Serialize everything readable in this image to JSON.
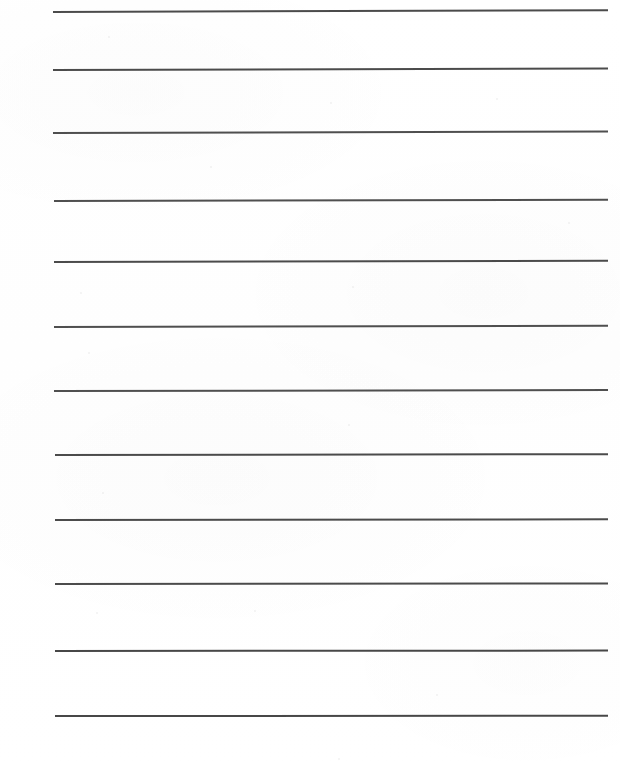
{
  "document": {
    "type": "scanned-blank-lined-paper",
    "title": "Blank lined writing paper",
    "orientation": "portrait",
    "page_width": 620,
    "page_height": 771,
    "background_color": "#ffffff",
    "text_content": "",
    "has_text": false,
    "has_header": false,
    "has_footer": false,
    "page_number": ""
  },
  "ruling": {
    "line_count": 12,
    "line_color": "#3c3c3c",
    "line_thickness_px": 2,
    "left_margin_px": 52,
    "right_margin_px": 12,
    "line_length_px": 556,
    "average_spacing_px": 64,
    "lines": [
      {
        "index": 1,
        "y": 11,
        "x_start": 53,
        "x_end": 608,
        "tilt_deg": -0.18,
        "thickness": 2.0,
        "opacity": 0.92
      },
      {
        "index": 2,
        "y": 69,
        "x_start": 53,
        "x_end": 608,
        "tilt_deg": -0.16,
        "thickness": 2.0,
        "opacity": 0.92
      },
      {
        "index": 3,
        "y": 132,
        "x_start": 53,
        "x_end": 608,
        "tilt_deg": -0.15,
        "thickness": 2.0,
        "opacity": 0.9
      },
      {
        "index": 4,
        "y": 200,
        "x_start": 54,
        "x_end": 608,
        "tilt_deg": -0.14,
        "thickness": 2.0,
        "opacity": 0.9
      },
      {
        "index": 5,
        "y": 261,
        "x_start": 54,
        "x_end": 608,
        "tilt_deg": -0.13,
        "thickness": 2.0,
        "opacity": 0.92
      },
      {
        "index": 6,
        "y": 326,
        "x_start": 54,
        "x_end": 608,
        "tilt_deg": -0.12,
        "thickness": 2.0,
        "opacity": 0.9
      },
      {
        "index": 7,
        "y": 390,
        "x_start": 54,
        "x_end": 608,
        "tilt_deg": -0.1,
        "thickness": 2.0,
        "opacity": 0.9
      },
      {
        "index": 8,
        "y": 454,
        "x_start": 55,
        "x_end": 608,
        "tilt_deg": -0.09,
        "thickness": 2.0,
        "opacity": 0.92
      },
      {
        "index": 9,
        "y": 519,
        "x_start": 55,
        "x_end": 608,
        "tilt_deg": -0.07,
        "thickness": 2.0,
        "opacity": 0.92
      },
      {
        "index": 10,
        "y": 583,
        "x_start": 55,
        "x_end": 608,
        "tilt_deg": -0.05,
        "thickness": 2.0,
        "opacity": 0.92
      },
      {
        "index": 11,
        "y": 650,
        "x_start": 55,
        "x_end": 608,
        "tilt_deg": -0.04,
        "thickness": 2.2,
        "opacity": 0.94
      },
      {
        "index": 12,
        "y": 715,
        "x_start": 55,
        "x_end": 608,
        "tilt_deg": -0.02,
        "thickness": 2.2,
        "opacity": 0.94
      }
    ]
  },
  "scan_artifacts": {
    "specks": [
      {
        "x": 108,
        "y": 36,
        "size": 2
      },
      {
        "x": 330,
        "y": 102,
        "size": 2
      },
      {
        "x": 496,
        "y": 98,
        "size": 2
      },
      {
        "x": 80,
        "y": 292,
        "size": 2
      },
      {
        "x": 352,
        "y": 286,
        "size": 2
      },
      {
        "x": 88,
        "y": 352,
        "size": 2
      },
      {
        "x": 348,
        "y": 424,
        "size": 2
      },
      {
        "x": 102,
        "y": 492,
        "size": 2
      },
      {
        "x": 96,
        "y": 612,
        "size": 2
      },
      {
        "x": 254,
        "y": 610,
        "size": 2
      },
      {
        "x": 436,
        "y": 694,
        "size": 2
      },
      {
        "x": 338,
        "y": 758,
        "size": 2
      },
      {
        "x": 568,
        "y": 222,
        "size": 2
      },
      {
        "x": 210,
        "y": 166,
        "size": 2
      }
    ]
  }
}
